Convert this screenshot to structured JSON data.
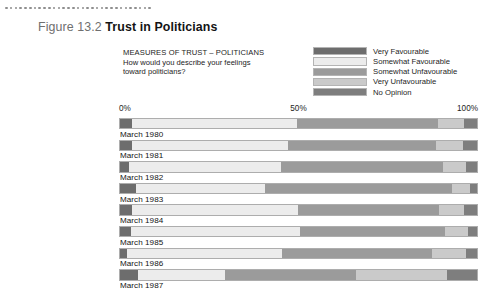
{
  "figure": {
    "number": "Figure 13.2",
    "title": "Trust in Politicians"
  },
  "question": {
    "heading": "MEASURES OF TRUST – POLITICIANS",
    "line1": "How would you describe your feelings",
    "line2": "toward politicians?"
  },
  "legend": {
    "items": [
      {
        "label": "Very Favourable",
        "color": "#6d6d6d"
      },
      {
        "label": "Somewhat Favourable",
        "color": "#ececec"
      },
      {
        "label": "Somewhat Unfavourable",
        "color": "#9b9b9b"
      },
      {
        "label": "Very Unfavourable",
        "color": "#cacaca"
      },
      {
        "label": "No Opinion",
        "color": "#7e7e7e"
      }
    ]
  },
  "axis": {
    "ticks": [
      "0%",
      "50%",
      "100%"
    ]
  },
  "chart_data": {
    "type": "bar",
    "subtype": "stacked-horizontal-100percent",
    "title": "Trust in Politicians",
    "subtitle": "MEASURES OF TRUST – POLITICIANS",
    "xlabel": "",
    "ylabel": "",
    "xlim": [
      0,
      100
    ],
    "xticks": [
      0,
      50,
      100
    ],
    "xtick_labels": [
      "0%",
      "50%",
      "100%"
    ],
    "grid": false,
    "legend_position": "top-right",
    "categories": [
      "March 1980",
      "March 1981",
      "March 1982",
      "March 1983",
      "March 1984",
      "March 1985",
      "March 1986",
      "March 1987"
    ],
    "series": [
      {
        "name": "Very Favourable",
        "color": "#6d6d6d",
        "values": [
          3.5,
          3.5,
          2.5,
          4.5,
          3.5,
          3.0,
          2.0,
          5.0
        ]
      },
      {
        "name": "Somewhat Favourable",
        "color": "#ececec",
        "values": [
          46.0,
          43.5,
          42.5,
          36.0,
          46.5,
          47.5,
          43.5,
          24.5
        ]
      },
      {
        "name": "Somewhat Unfavourable",
        "color": "#9b9b9b",
        "values": [
          39.5,
          41.5,
          45.5,
          52.5,
          39.5,
          40.5,
          42.0,
          36.5
        ]
      },
      {
        "name": "Very Unfavourable",
        "color": "#cacaca",
        "values": [
          7.5,
          7.5,
          6.5,
          5.0,
          7.0,
          6.5,
          9.5,
          25.5
        ]
      },
      {
        "name": "No Opinion",
        "color": "#7e7e7e",
        "values": [
          3.5,
          4.0,
          3.0,
          2.0,
          3.5,
          2.5,
          3.0,
          8.5
        ]
      }
    ]
  }
}
